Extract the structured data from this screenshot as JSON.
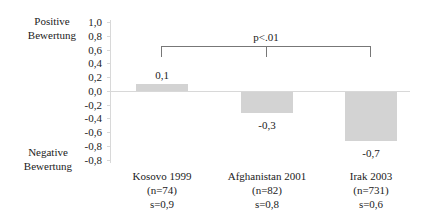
{
  "chart_data": {
    "type": "bar",
    "categories": [
      "Kosovo 1999",
      "Afghanistan 2001",
      "Irak 2003"
    ],
    "values": [
      0.1,
      -0.3,
      -0.7
    ],
    "value_labels": [
      "0,1",
      "-0,3",
      "-0,7"
    ],
    "category_details": [
      {
        "name": "Kosovo 1999",
        "n": "(n=74)",
        "s": "s=0,9"
      },
      {
        "name": "Afghanistan 2001",
        "n": "(n=82)",
        "s": "s=0,8"
      },
      {
        "name": "Irak 2003",
        "n": "(n=731)",
        "s": "s=0,6"
      }
    ],
    "yticks": [
      "1,0",
      "0,8",
      "0,6",
      "0,4",
      "0,2",
      "0,0",
      "-0,2",
      "-0,4",
      "-0,6",
      "-0,8",
      "-0,8"
    ],
    "ylim": [
      -1.0,
      1.0
    ],
    "top_label": [
      "Positive",
      "Bewertung"
    ],
    "bottom_label": [
      "Negative",
      "Bewertung"
    ],
    "annotation": "p<.01",
    "bar_color": "#d3d3d3",
    "grid": false,
    "legend": null
  }
}
